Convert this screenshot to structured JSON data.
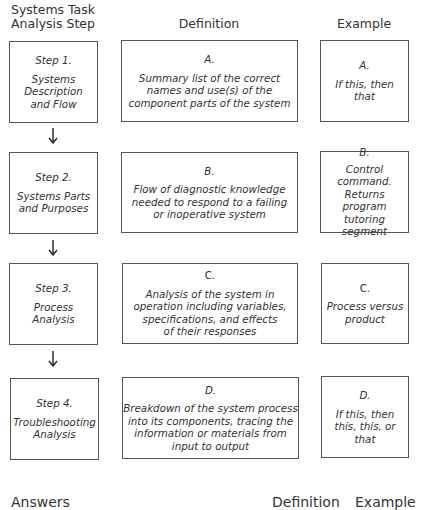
{
  "headers": {
    "step": "Systems Task\nAnalysis Step",
    "definition": "Definition",
    "example": "Example"
  },
  "rows": [
    {
      "step_label": "Step 1.",
      "step_text": "Systems\nDescription\nand Flow",
      "def_label": "A.",
      "def_text": "Summary list of the correct\nnames and use(s) of the\ncomponent parts of the system",
      "ex_label": "A.",
      "ex_text": "If this, then\nthat"
    },
    {
      "step_label": "Step 2.",
      "step_text": "Systems Parts\nand Purposes",
      "def_label": "B.",
      "def_text": "Flow of diagnostic knowledge\nneeded to respond to a failing\nor inoperative system",
      "ex_label": "B.",
      "ex_text": "Control\ncommand.\nReturns program\ntutoring segment"
    },
    {
      "step_label": "Step 3.",
      "step_text": "Process\nAnalysis",
      "def_label": "C.",
      "def_text": "Analysis of the system in\noperation including variables,\nspecifications, and effects\nof their responses",
      "ex_label": "C.",
      "ex_text": "Process versus\nproduct"
    },
    {
      "step_label": "Step 4.",
      "step_text": "Troubleshooting\nAnalysis",
      "def_label": "D.",
      "def_text": "Breakdown of the system process\ninto its components, tracing the\ninformation or materials from\ninput to output",
      "ex_label": "D.",
      "ex_text": "If this, then\nthis, this, or\nthat"
    }
  ],
  "footer": {
    "answers": "Answers",
    "definition": "Definition",
    "example": "Example"
  }
}
